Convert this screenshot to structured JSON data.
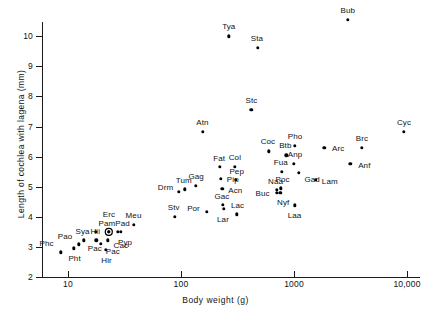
{
  "chart_data": {
    "type": "scatter",
    "title": "",
    "xlabel": "Body weight (g)",
    "ylabel": "Length of cochlea with lagena (mm)",
    "xscale": "log",
    "yscale": "linear",
    "xlim": [
      8,
      12000
    ],
    "ylim": [
      2,
      10.8
    ],
    "grid": false,
    "legend": false,
    "xticks": [
      "10",
      "100",
      "1000",
      "10,000"
    ],
    "xtick_values": [
      10,
      100,
      1000,
      10000
    ],
    "yticks": [
      "2",
      "3",
      "4",
      "5",
      "6",
      "7",
      "8",
      "9",
      "10"
    ],
    "ytick_values": [
      2,
      3,
      4,
      5,
      6,
      7,
      8,
      9,
      10
    ],
    "point_count": 50,
    "points": [
      {
        "label": "Phc",
        "x": 8.6,
        "y": 2.82,
        "lx": -14,
        "ly": -9,
        "ringed": false
      },
      {
        "label": "Pht",
        "x": 11.2,
        "y": 2.95,
        "lx": 1,
        "ly": 10,
        "ringed": false
      },
      {
        "label": "Pao",
        "x": 12.5,
        "y": 3.09,
        "lx": -14,
        "ly": -8,
        "ringed": false
      },
      {
        "label": "Pac",
        "x": 13.8,
        "y": 3.22,
        "lx": 11,
        "ly": 8,
        "ringed": false
      },
      {
        "label": "Sya",
        "x": 17.5,
        "y": 3.5,
        "lx": -13,
        "ly": -1,
        "ringed": false
      },
      {
        "label": "Hii",
        "x": 17.8,
        "y": 3.22,
        "lx": -1,
        "ly": -9,
        "ringed": false
      },
      {
        "label": "Pac2",
        "x": 19.5,
        "y": 3.1,
        "lx": 12,
        "ly": 7,
        "ringed": false
      },
      {
        "label": "Hir",
        "x": 21.5,
        "y": 2.9,
        "lx": 1,
        "ly": 10,
        "ringed": false
      },
      {
        "label": "Cac",
        "x": 22.5,
        "y": 3.22,
        "lx": 13,
        "ly": 5,
        "ringed": false
      },
      {
        "label": "Pam",
        "x": 23.0,
        "y": 3.5,
        "lx": -2,
        "ly": -9,
        "ringed": true
      },
      {
        "label": "Erc",
        "x": 23.0,
        "y": 3.5,
        "lx": 0,
        "ly": -18,
        "ringed": false
      },
      {
        "label": "Pad",
        "x": 27.5,
        "y": 3.5,
        "lx": 5,
        "ly": -9,
        "ringed": false
      },
      {
        "label": "Pyp",
        "x": 29.5,
        "y": 3.5,
        "lx": 4,
        "ly": 10,
        "ringed": false
      },
      {
        "label": "Meu",
        "x": 38.0,
        "y": 3.74,
        "lx": 0,
        "ly": -10,
        "ringed": false
      },
      {
        "label": "Stv",
        "x": 88.0,
        "y": 4.01,
        "lx": -1,
        "ly": -10,
        "ringed": false
      },
      {
        "label": "Drm",
        "x": 95.0,
        "y": 4.82,
        "lx": -13,
        "ly": -5,
        "ringed": false
      },
      {
        "label": "Tum",
        "x": 108.0,
        "y": 4.91,
        "lx": -1,
        "ly": -9,
        "ringed": false
      },
      {
        "label": "Gag",
        "x": 136.0,
        "y": 5.03,
        "lx": 0,
        "ly": -10,
        "ringed": false
      },
      {
        "label": "Atn",
        "x": 155.0,
        "y": 6.82,
        "lx": 0,
        "ly": -10,
        "ringed": false
      },
      {
        "label": "Por",
        "x": 168.0,
        "y": 4.17,
        "lx": -13,
        "ly": -4,
        "ringed": false
      },
      {
        "label": "Fat",
        "x": 222.0,
        "y": 5.67,
        "lx": -1,
        "ly": -9,
        "ringed": false
      },
      {
        "label": "Pip",
        "x": 225.0,
        "y": 5.27,
        "lx": 12,
        "ly": 0,
        "ringed": false
      },
      {
        "label": "Acn",
        "x": 232.0,
        "y": 4.92,
        "lx": 13,
        "ly": 1,
        "ringed": false
      },
      {
        "label": "Gac",
        "x": 235.0,
        "y": 4.4,
        "lx": -1,
        "ly": -9,
        "ringed": false
      },
      {
        "label": "Lar",
        "x": 240.0,
        "y": 4.27,
        "lx": -1,
        "ly": 10,
        "ringed": false
      },
      {
        "label": "Col",
        "x": 300.0,
        "y": 5.67,
        "lx": 0,
        "ly": -10,
        "ringed": false
      },
      {
        "label": "Pep",
        "x": 305.0,
        "y": 5.23,
        "lx": 1,
        "ly": -9,
        "ringed": false
      },
      {
        "label": "Lac",
        "x": 310.0,
        "y": 4.08,
        "lx": 1,
        "ly": -9,
        "ringed": false
      },
      {
        "label": "Stc",
        "x": 420.0,
        "y": 7.55,
        "lx": 0,
        "ly": -10,
        "ringed": false
      },
      {
        "label": "Tya",
        "x": 265.0,
        "y": 10.0,
        "lx": 0,
        "ly": -10,
        "ringed": false
      },
      {
        "label": "Sta",
        "x": 480.0,
        "y": 9.62,
        "lx": -1,
        "ly": -10,
        "ringed": false
      },
      {
        "label": "Coc",
        "x": 600.0,
        "y": 6.18,
        "lx": -1,
        "ly": -10,
        "ringed": false
      },
      {
        "label": "Naa",
        "x": 700.0,
        "y": 4.9,
        "lx": -1,
        "ly": -9,
        "ringed": false
      },
      {
        "label": "Buc",
        "x": 700.0,
        "y": 4.79,
        "lx": -14,
        "ly": 0,
        "ringed": false
      },
      {
        "label": "Poc",
        "x": 760.0,
        "y": 4.95,
        "lx": 2,
        "ly": -9,
        "ringed": false
      },
      {
        "label": "Nyf",
        "x": 755.0,
        "y": 4.8,
        "lx": 3,
        "ly": 9,
        "ringed": false
      },
      {
        "label": "Fua",
        "x": 780.0,
        "y": 5.5,
        "lx": -1,
        "ly": -10,
        "ringed": false
      },
      {
        "label": "Btb",
        "x": 855.0,
        "y": 6.04,
        "lx": -1,
        "ly": -10,
        "ringed": false
      },
      {
        "label": "Anp",
        "x": 1000.0,
        "y": 5.77,
        "lx": 1,
        "ly": -10,
        "ringed": false
      },
      {
        "label": "Pho",
        "x": 1020.0,
        "y": 6.35,
        "lx": 0,
        "ly": -10,
        "ringed": false
      },
      {
        "label": "Laa",
        "x": 1010.0,
        "y": 4.38,
        "lx": 0,
        "ly": 10,
        "ringed": false
      },
      {
        "label": "Gad",
        "x": 1110.0,
        "y": 5.47,
        "lx": 13,
        "ly": 6,
        "ringed": false
      },
      {
        "label": "Lam",
        "x": 1560.0,
        "y": 5.22,
        "lx": 14,
        "ly": 1,
        "ringed": false
      },
      {
        "label": "Arc",
        "x": 1850.0,
        "y": 6.3,
        "lx": 14,
        "ly": 0,
        "ringed": false
      },
      {
        "label": "Bub",
        "x": 3000.0,
        "y": 10.55,
        "lx": 0,
        "ly": -10,
        "ringed": false
      },
      {
        "label": "Anf",
        "x": 3150.0,
        "y": 5.77,
        "lx": 14,
        "ly": 1,
        "ringed": false
      },
      {
        "label": "Brc",
        "x": 4000.0,
        "y": 6.3,
        "lx": 0,
        "ly": -10,
        "ringed": false
      },
      {
        "label": "Cyc",
        "x": 9400.0,
        "y": 6.82,
        "lx": 0,
        "ly": -10,
        "ringed": false
      }
    ]
  },
  "axes": {
    "x_title": "Body weight (g)",
    "y_title": "Length of cochlea with lagena (mm)"
  }
}
